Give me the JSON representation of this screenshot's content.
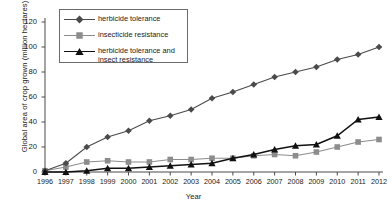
{
  "chart_data": {
    "type": "line",
    "title": "",
    "xlabel": "Year",
    "ylabel": "Global area of crop grown (million hectares)",
    "ylim": [
      0,
      120
    ],
    "yticks": [
      0,
      20,
      40,
      60,
      80,
      100,
      120
    ],
    "grid": false,
    "legend_position": "top-left-inside",
    "categories": [
      1996,
      1997,
      1998,
      1999,
      2000,
      2001,
      2002,
      2003,
      2004,
      2005,
      2006,
      2007,
      2008,
      2009,
      2010,
      2011,
      2012
    ],
    "x": [
      "1996",
      "1997",
      "1998",
      "1999",
      "2000",
      "2001",
      "2002",
      "2003",
      "2004",
      "2005",
      "2006",
      "2007",
      "2008",
      "2009",
      "2010",
      "2011",
      "2012"
    ],
    "series": [
      {
        "name": "herbicide tolerance",
        "marker": "diamond",
        "color": "#4a4a4a",
        "values": [
          1,
          7,
          20,
          28,
          33,
          41,
          45,
          50,
          59,
          64,
          70,
          76,
          80,
          84,
          90,
          94,
          100
        ]
      },
      {
        "name": "insecticide resistance",
        "marker": "square",
        "color": "#8c8c8c",
        "values": [
          1,
          4,
          8,
          9,
          8,
          8,
          10,
          10,
          11,
          11,
          13,
          14,
          13,
          16,
          20,
          24,
          26
        ]
      },
      {
        "name": "herbicide tolerance and insect resistance",
        "marker": "triangle",
        "color": "#111111",
        "values": [
          0,
          0,
          1,
          3,
          3,
          4,
          5,
          6,
          7,
          11,
          14,
          18,
          21,
          22,
          29,
          42,
          44
        ]
      }
    ]
  },
  "axis": {
    "ylabel": "Global area of crop grown (million hectares)",
    "xlabel": "Year",
    "ytick_labels": [
      "120",
      "100",
      "80",
      "60",
      "40",
      "20",
      "0"
    ],
    "xtick_labels": [
      "1996",
      "1997",
      "1998",
      "1999",
      "2000",
      "2001",
      "2002",
      "2003",
      "2004",
      "2005",
      "2006",
      "2007",
      "2008",
      "2009",
      "2010",
      "2011",
      "2012"
    ]
  },
  "legend": {
    "items": [
      {
        "label": "herbicide tolerance",
        "marker": "diamond-marker",
        "color": "#4a4a4a"
      },
      {
        "label": "insecticide resistance",
        "marker": "square-marker",
        "color": "#8c8c8c"
      },
      {
        "label": "herbicide tolerance and insect resistance",
        "marker": "triangle-marker",
        "color": "#111111"
      }
    ]
  }
}
